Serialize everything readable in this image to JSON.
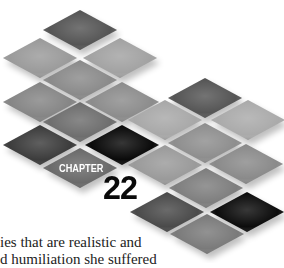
{
  "chapter": {
    "label": "CHAPTER",
    "number": "22"
  },
  "body_text": {
    "lines": [
      "ies that are realistic and",
      "d humiliation she suffered"
    ]
  },
  "tiles": [
    {
      "cx": 80,
      "cy": 30,
      "color": "#555555"
    },
    {
      "cx": 40,
      "cy": 58,
      "color": "#9a9a9a"
    },
    {
      "cx": 120,
      "cy": 58,
      "color": "#a2a2a2"
    },
    {
      "cx": 80,
      "cy": 80,
      "color": "#8a8a8a"
    },
    {
      "cx": 40,
      "cy": 102,
      "color": "#858585"
    },
    {
      "cx": 122,
      "cy": 102,
      "color": "#8c8c8c"
    },
    {
      "cx": 205,
      "cy": 98,
      "color": "#555555"
    },
    {
      "cx": 80,
      "cy": 122,
      "color": "#6e6e6e"
    },
    {
      "cx": 165,
      "cy": 120,
      "color": "#a8a8a8"
    },
    {
      "cx": 248,
      "cy": 120,
      "color": "#aaaaaa"
    },
    {
      "cx": 40,
      "cy": 145,
      "color": "#3c3c3c"
    },
    {
      "cx": 122,
      "cy": 145,
      "color": "#0a0a0a"
    },
    {
      "cx": 205,
      "cy": 143,
      "color": "#8e8e8e"
    },
    {
      "cx": 80,
      "cy": 168,
      "color": "#6a6a6a"
    },
    {
      "cx": 165,
      "cy": 165,
      "color": "#9a9a9a"
    },
    {
      "cx": 246,
      "cy": 164,
      "color": "#8a8a8a"
    },
    {
      "cx": 206,
      "cy": 188,
      "color": "#7e7e7e"
    },
    {
      "cx": 167,
      "cy": 212,
      "color": "#4a4a4a"
    },
    {
      "cx": 247,
      "cy": 212,
      "color": "#0c0c0c"
    },
    {
      "cx": 207,
      "cy": 234,
      "color": "#7a7a7a"
    }
  ],
  "tile_size": {
    "w": 74,
    "h": 40
  }
}
